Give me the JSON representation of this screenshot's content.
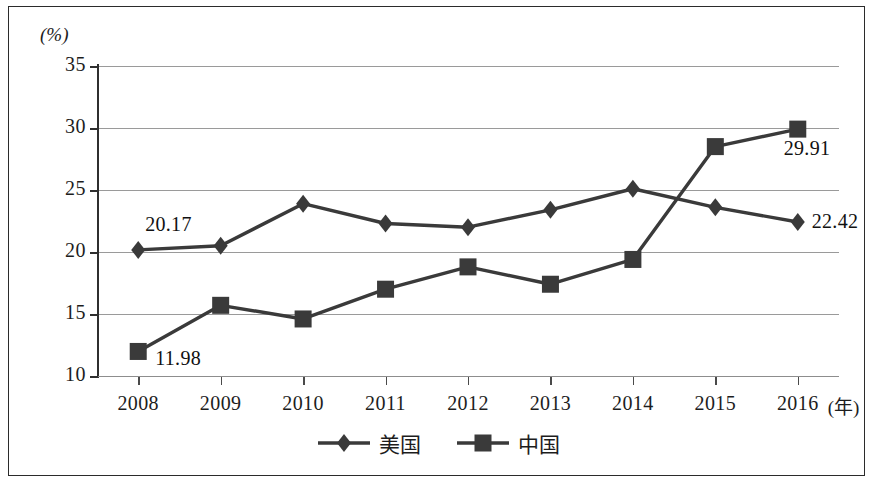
{
  "chart_data": {
    "type": "line",
    "title": "",
    "subtitle": "",
    "xlabel": "(年)",
    "ylabel": "(%)",
    "unit_top_left": "(%)",
    "x_axis_unit": "(年)",
    "categories": [
      "2008",
      "2009",
      "2010",
      "2011",
      "2012",
      "2013",
      "2014",
      "2015",
      "2016"
    ],
    "ylim": [
      10,
      35
    ],
    "yticks": [
      10,
      15,
      20,
      25,
      30,
      35
    ],
    "ytick_labels": [
      "10",
      "15",
      "20",
      "25",
      "30",
      "35"
    ],
    "grid": true,
    "legend_position": "bottom-center",
    "series": [
      {
        "name": "美国",
        "marker": "diamond",
        "color": "#3a3a3a",
        "values": [
          20.17,
          20.5,
          23.9,
          22.3,
          22.0,
          23.4,
          25.1,
          23.6,
          22.42
        ]
      },
      {
        "name": "中国",
        "marker": "square",
        "color": "#3a3a3a",
        "values": [
          11.98,
          15.7,
          14.6,
          17.0,
          18.8,
          17.4,
          19.4,
          28.5,
          29.91
        ]
      }
    ],
    "annotations": [
      {
        "text": "20.17",
        "series": "美国",
        "category": "2008",
        "value": 20.17,
        "position": "above-right"
      },
      {
        "text": "22.42",
        "series": "美国",
        "category": "2016",
        "value": 22.42,
        "position": "right"
      },
      {
        "text": "11.98",
        "series": "中国",
        "category": "2008",
        "value": 11.98,
        "position": "below-right"
      },
      {
        "text": "29.91",
        "series": "中国",
        "category": "2016",
        "value": 29.91,
        "position": "below-left"
      }
    ]
  },
  "legend": {
    "items": [
      {
        "label": "美国",
        "marker": "diamond-marker-icon"
      },
      {
        "label": "中国",
        "marker": "square-marker-icon"
      }
    ]
  }
}
